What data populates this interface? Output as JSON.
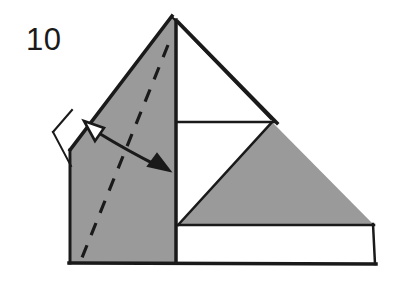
{
  "figure": {
    "step_number": "10",
    "caption": "",
    "colors": {
      "paper_front": "#ffffff",
      "paper_back": "#9a9a9a",
      "line": "#1a1a1a",
      "background": "#ffffff",
      "text": "#1a1a1a"
    },
    "shapes": [
      {
        "name": "white-base-bottom-band",
        "kind": "polygon",
        "fill": "paper_front",
        "points": "70,263 375,264 373,224 178,225"
      },
      {
        "name": "white-center-square",
        "kind": "polygon",
        "fill": "paper_front",
        "points": "178,122 272,122 178,225"
      },
      {
        "name": "white-upper-right-triangle",
        "kind": "polygon",
        "fill": "paper_front",
        "points": "176,24 272,120 178,120"
      },
      {
        "name": "white-left-flap",
        "kind": "polygon",
        "fill": "paper_front",
        "points": "53,132 72,110 72,165"
      },
      {
        "name": "gray-left-panel",
        "kind": "polygon",
        "fill": "paper_back",
        "points": "172,16 70,150 70,263 175,263 175,20"
      },
      {
        "name": "gray-right-triangle",
        "kind": "polygon",
        "fill": "paper_back",
        "points": "272,122 373,224 178,224"
      }
    ],
    "lines": [
      {
        "name": "outline-apex-to-left",
        "x1": 172,
        "y1": 16,
        "x2": 70,
        "y2": 150,
        "weight": 3
      },
      {
        "name": "outline-apex-to-right",
        "x1": 176,
        "y1": 22,
        "x2": 276,
        "y2": 122,
        "weight": 3
      },
      {
        "name": "outline-apex-inner-right",
        "x1": 172,
        "y1": 16,
        "x2": 272,
        "y2": 118,
        "weight": 2
      },
      {
        "name": "outline-left-vertical",
        "x1": 70,
        "y1": 150,
        "x2": 70,
        "y2": 263,
        "weight": 3
      },
      {
        "name": "outline-bottom",
        "x1": 70,
        "y1": 263,
        "x2": 375,
        "y2": 264,
        "weight": 3
      },
      {
        "name": "outline-right-vertical",
        "x1": 375,
        "y1": 264,
        "x2": 373,
        "y2": 224,
        "weight": 2
      },
      {
        "name": "edge-center-vertical",
        "x1": 175,
        "y1": 20,
        "x2": 175,
        "y2": 263,
        "weight": 3
      },
      {
        "name": "edge-horizontal-mid",
        "x1": 178,
        "y1": 122,
        "x2": 273,
        "y2": 122,
        "weight": 2
      },
      {
        "name": "edge-gray-triangle-hypotenuse",
        "x1": 178,
        "y1": 224,
        "x2": 272,
        "y2": 122,
        "weight": 2
      },
      {
        "name": "edge-gray-triangle-base",
        "x1": 178,
        "y1": 224,
        "x2": 373,
        "y2": 224,
        "weight": 2
      },
      {
        "name": "flap-edge-upper",
        "x1": 53,
        "y1": 132,
        "x2": 72,
        "y2": 110,
        "weight": 2
      },
      {
        "name": "flap-edge-lower",
        "x1": 53,
        "y1": 132,
        "x2": 71,
        "y2": 166,
        "weight": 2
      }
    ],
    "fold_line": {
      "name": "valley-fold-dashed",
      "style": "dashed",
      "x1": 168,
      "y1": 45,
      "x2": 79,
      "y2": 265,
      "dash_pattern": "13 11"
    },
    "arrow": {
      "name": "double-headed-fold-arrow",
      "style": "double-headed-curved",
      "path": "M 94,130 Q 128,150 161,167",
      "head_start": {
        "name": "arrowhead-hollow-up-left",
        "filled": false,
        "points": "85,122 103,129 95,140"
      },
      "head_end": {
        "name": "arrowhead-solid-down-right",
        "filled": true,
        "points": "168,170 149,166 157,156"
      }
    }
  }
}
